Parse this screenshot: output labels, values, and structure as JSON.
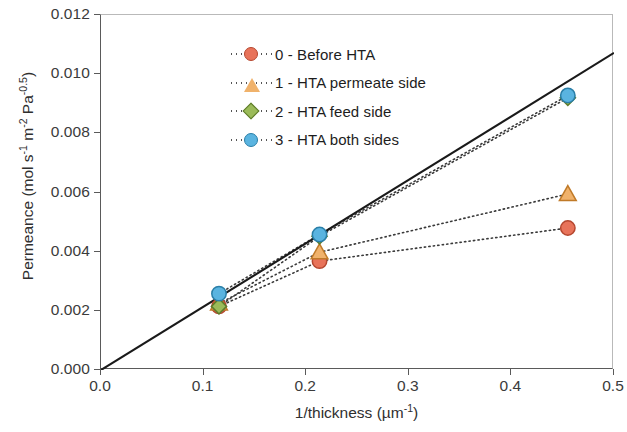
{
  "chart_data": {
    "type": "scatter",
    "title": "",
    "xlabel": "1/thickness (µm⁻¹)",
    "ylabel": "Permeance (mol s⁻¹ m⁻² Pa⁻⁰·⁵)",
    "xlim": [
      0.0,
      0.5
    ],
    "ylim": [
      0.0,
      0.012
    ],
    "xticks": [
      "0.0",
      "0.1",
      "0.2",
      "0.3",
      "0.4",
      "0.5"
    ],
    "xtick_values": [
      0.0,
      0.1,
      0.2,
      0.3,
      0.4,
      0.5
    ],
    "yticks": [
      "0.000",
      "0.002",
      "0.004",
      "0.006",
      "0.008",
      "0.010",
      "0.012"
    ],
    "ytick_values": [
      0.0,
      0.002,
      0.004,
      0.006,
      0.008,
      0.01,
      0.012
    ],
    "grid": false,
    "legend_position": "upper-left-inside",
    "x": [
      0.115,
      0.213,
      0.455
    ],
    "series": [
      {
        "name": "0 - Before HTA",
        "marker": "circle",
        "color": "#e8735a",
        "edge_color": "#b5472f",
        "line_style": "dotted",
        "values": [
          0.00215,
          0.00368,
          0.0048
        ]
      },
      {
        "name": "1 - HTA permeate side",
        "marker": "triangle",
        "color": "#f0b26b",
        "edge_color": "#c07a28",
        "line_style": "dotted",
        "values": [
          0.00225,
          0.00398,
          0.00595
        ]
      },
      {
        "name": "2 - HTA feed side",
        "marker": "diamond",
        "color": "#9bbb59",
        "edge_color": "#5d7a2a",
        "line_style": "dotted",
        "values": [
          0.00215,
          0.00452,
          0.0092
        ]
      },
      {
        "name": "3 - HTA both sides",
        "marker": "circle",
        "color": "#5ab4e0",
        "edge_color": "#2a7fa8",
        "line_style": "dotted",
        "values": [
          0.00258,
          0.00458,
          0.00928
        ]
      }
    ],
    "reference_line": {
      "name": "ideal-linear-trend",
      "style": "solid",
      "color": "#1a1a1a",
      "x": [
        0.0,
        0.5
      ],
      "y": [
        0.0,
        0.01072
      ]
    },
    "legend": [
      "0 - Before HTA",
      "1 - HTA permeate side",
      "2 - HTA feed side",
      "3 - HTA both sides"
    ]
  }
}
